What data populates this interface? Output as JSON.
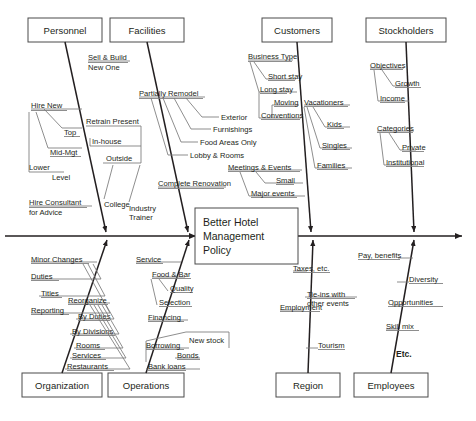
{
  "diagram": {
    "type": "fishbone-ishikawa",
    "core_effect": {
      "lines": [
        "Better Hotel",
        "Management",
        "Policy"
      ]
    },
    "extra_note": "Etc.",
    "categories": [
      {
        "id": "personnel",
        "label": "Personnel",
        "position": "top",
        "causes": [
          {
            "label": "Hire New"
          },
          {
            "label": "Top"
          },
          {
            "label": "Mid-Mgt"
          },
          {
            "label": "Lower"
          },
          {
            "label": "Level"
          },
          {
            "label": "Hire Consultant"
          },
          {
            "label": "for Advice"
          }
        ]
      },
      {
        "id": "facilities",
        "label": "Facilities",
        "position": "top",
        "causes": [
          {
            "label": "Sell & Build"
          },
          {
            "label": "New One"
          },
          {
            "label": "Partially Remodel"
          },
          {
            "label": "Exterior"
          },
          {
            "label": "Furnishings"
          },
          {
            "label": "Food Areas Only"
          },
          {
            "label": "Lobby & Rooms"
          },
          {
            "label": "Complete Renovation"
          },
          {
            "label": "Retrain Present"
          },
          {
            "label": "In-house"
          },
          {
            "label": "Outside"
          },
          {
            "label": "College"
          },
          {
            "label": "Industry"
          },
          {
            "label": "Trainer"
          }
        ]
      },
      {
        "id": "customers",
        "label": "Customers",
        "position": "top",
        "causes": [
          {
            "label": "Business Type"
          },
          {
            "label": "Short stay"
          },
          {
            "label": "Long stay"
          },
          {
            "label": "Moving"
          },
          {
            "label": "Conventions"
          },
          {
            "label": "Vacationers"
          },
          {
            "label": "Kids"
          },
          {
            "label": "Singles"
          },
          {
            "label": "Families"
          },
          {
            "label": "Meetings & Events"
          },
          {
            "label": "Small"
          },
          {
            "label": "Major events"
          }
        ]
      },
      {
        "id": "stockholders",
        "label": "Stockholders",
        "position": "top",
        "causes": [
          {
            "label": "Objectives"
          },
          {
            "label": "Growth"
          },
          {
            "label": "Income"
          },
          {
            "label": "Categories"
          },
          {
            "label": "Private"
          },
          {
            "label": "Institutional"
          }
        ]
      },
      {
        "id": "organization",
        "label": "Organization",
        "position": "bottom",
        "causes": [
          {
            "label": "Minor Changes"
          },
          {
            "label": "Duties"
          },
          {
            "label": "Titles"
          },
          {
            "label": "Reporting"
          },
          {
            "label": "Reorganize"
          },
          {
            "label": "By Duties"
          },
          {
            "label": "By Divisions"
          },
          {
            "label": "Rooms"
          },
          {
            "label": "Services"
          },
          {
            "label": "Restaurants"
          }
        ]
      },
      {
        "id": "operations",
        "label": "Operations",
        "position": "bottom",
        "causes": [
          {
            "label": "Service"
          },
          {
            "label": "Food & Bar"
          },
          {
            "label": "Quality"
          },
          {
            "label": "Selection"
          },
          {
            "label": "Financing"
          },
          {
            "label": "New stock"
          },
          {
            "label": "Borrowing"
          },
          {
            "label": "Bonds"
          },
          {
            "label": "Bank loans"
          }
        ]
      },
      {
        "id": "region",
        "label": "Region",
        "position": "bottom",
        "causes": [
          {
            "label": "Taxes, etc."
          },
          {
            "label": "Tie-ins with"
          },
          {
            "label": "other events"
          },
          {
            "label": "Employment"
          },
          {
            "label": "Tourism"
          }
        ]
      },
      {
        "id": "employees",
        "label": "Employees",
        "position": "bottom",
        "causes": [
          {
            "label": "Pay, benefits"
          },
          {
            "label": "Diversity"
          },
          {
            "label": "Opportunities"
          },
          {
            "label": "Skill mix"
          }
        ]
      }
    ]
  },
  "labels": {
    "personnel": "Personnel",
    "facilities": "Facilities",
    "customers": "Customers",
    "stockholders": "Stockholders",
    "organization": "Organization",
    "operations": "Operations",
    "region": "Region",
    "employees": "Employees",
    "core_l1": "Better Hotel",
    "core_l2": "Management",
    "core_l3": "Policy",
    "etc": "Etc.",
    "p_hire_new": "Hire New",
    "p_top": "Top",
    "p_mid_mgt": "Mid-Mgt",
    "p_lower": "Lower",
    "p_level": "Level",
    "p_hire_consultant": "Hire Consultant",
    "p_for_advice": "for Advice",
    "f_sell_build": "Sell & Build",
    "f_new_one": "New One",
    "f_partially_remodel": "Partially Remodel",
    "f_exterior": "Exterior",
    "f_furnishings": "Furnishings",
    "f_food_areas": "Food Areas Only",
    "f_lobby_rooms": "Lobby & Rooms",
    "f_complete_renovation": "Complete Renovation",
    "f_retrain_present": "Retrain Present",
    "f_in_house": "In-house",
    "f_outside": "Outside",
    "f_college": "College",
    "f_industry": "Industry",
    "f_trainer": "Trainer",
    "c_business_type": "Business Type",
    "c_short_stay": "Short stay",
    "c_long_stay": "Long stay",
    "c_moving": "Moving",
    "c_conventions": "Conventions",
    "c_vacationers": "Vacationers",
    "c_kids": "Kids",
    "c_singles": "Singles",
    "c_families": "Families",
    "c_meetings_events": "Meetings & Events",
    "c_small": "Small",
    "c_major_events": "Major events",
    "s_objectives": "Objectives",
    "s_growth": "Growth",
    "s_income": "Income",
    "s_categories": "Categories",
    "s_private": "Private",
    "s_institutional": "Institutional",
    "o_minor_changes": "Minor Changes",
    "o_duties": "Duties",
    "o_titles": "Titles",
    "o_reporting": "Reporting",
    "o_reorganize": "Reorganize",
    "o_by_duties": "By Duties",
    "o_by_divisions": "By Divisions",
    "o_rooms": "Rooms",
    "o_services": "Services",
    "o_restaurants": "Restaurants",
    "op_service": "Service",
    "op_food_bar": "Food & Bar",
    "op_quality": "Quality",
    "op_selection": "Selection",
    "op_financing": "Financing",
    "op_new_stock": "New stock",
    "op_borrowing": "Borrowing",
    "op_bonds": "Bonds",
    "op_bank_loans": "Bank loans",
    "r_taxes": "Taxes, etc.",
    "r_tieins_1": "Tie-ins with",
    "r_tieins_2": "other events",
    "r_employment": "Employment",
    "r_tourism": "Tourism",
    "e_pay_benefits": "Pay, benefits",
    "e_diversity": "Diversity",
    "e_opportunities": "Opportunities",
    "e_skill_mix": "Skill mix"
  },
  "colors": {
    "ink": "#231f20",
    "box_stroke": "#4a4a4a",
    "twig": "#7a7a7a",
    "background": "#ffffff"
  }
}
